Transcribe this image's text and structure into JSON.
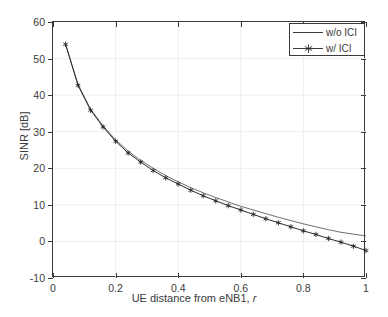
{
  "chart_data": {
    "type": "line",
    "title": "",
    "xlabel": "UE distance from eNB1, r",
    "xlabel_plain": "UE distance from eNB1,",
    "xlabel_italic": "r",
    "ylabel": "SINR [dB]",
    "xlim": [
      0,
      1
    ],
    "ylim": [
      -10,
      60
    ],
    "xticks": [
      0,
      0.2,
      0.4,
      0.6,
      0.8,
      1
    ],
    "xticklabels": [
      "0",
      "0.2",
      "0.4",
      "0.6",
      "0.8",
      "1"
    ],
    "yticks": [
      -10,
      0,
      10,
      20,
      30,
      40,
      50,
      60
    ],
    "yticklabels": [
      "-10",
      "0",
      "10",
      "20",
      "30",
      "40",
      "50",
      "60"
    ],
    "grid": true,
    "grid_color": "#ededed",
    "axis_color": "#3a3a3a",
    "legend_position": "top-right",
    "x": [
      0.04,
      0.08,
      0.12,
      0.16,
      0.2,
      0.24,
      0.28,
      0.32,
      0.36,
      0.4,
      0.44,
      0.48,
      0.52,
      0.56,
      0.6,
      0.64,
      0.68,
      0.72,
      0.76,
      0.8,
      0.84,
      0.88,
      0.92,
      0.96,
      1.0
    ],
    "series": [
      {
        "name": "w/o ICI",
        "marker": "none",
        "color": "#555555",
        "values": [
          54.0,
          42.9,
          36.2,
          31.6,
          27.8,
          24.7,
          22.2,
          20.0,
          18.0,
          16.3,
          14.7,
          13.3,
          12.0,
          10.8,
          9.6,
          8.6,
          7.6,
          6.6,
          5.7,
          4.8,
          4.0,
          3.2,
          2.5,
          2.0,
          1.5
        ]
      },
      {
        "name": "w/ ICI",
        "marker": "asterisk",
        "color": "#222222",
        "values": [
          53.9,
          42.7,
          35.9,
          31.3,
          27.4,
          24.2,
          21.7,
          19.4,
          17.4,
          15.7,
          14.0,
          12.5,
          11.1,
          9.8,
          8.6,
          7.4,
          6.2,
          5.1,
          4.0,
          2.9,
          1.9,
          0.8,
          -0.2,
          -1.3,
          -2.5
        ]
      }
    ]
  },
  "legend": {
    "items": [
      {
        "label": "w/o ICI"
      },
      {
        "label": "w/ ICI"
      }
    ]
  }
}
